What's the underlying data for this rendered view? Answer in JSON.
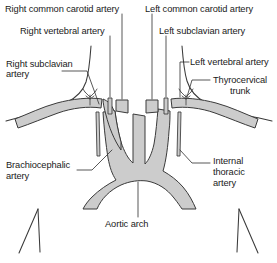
{
  "figure": {
    "type": "anatomical-line-diagram",
    "background_color": "#ffffff",
    "vessel_fill_color": "#cccccc",
    "vessel_outline_color": "#333333",
    "label_color": "#1a1a1a",
    "leader_line_color": "#333333"
  },
  "labels": {
    "right_common_carotid": "Right common carotid artery",
    "right_vertebral": "Right vertebral artery",
    "right_subclavian_line1": "Right subclavian",
    "right_subclavian_line2": "artery",
    "brachiocephalic_line1": "Brachiocephalic",
    "brachiocephalic_line2": "artery",
    "aortic_arch": "Aortic arch",
    "left_common_carotid": "Left common carotid artery",
    "left_subclavian": "Left subclavian artery",
    "left_vertebral": "Left vertebral artery",
    "thyrocervical_line1": "Thyrocervical",
    "thyrocervical_line2": "trunk",
    "internal_thoracic_line1": "Internal",
    "internal_thoracic_line2": "thoracic",
    "internal_thoracic_line3": "artery"
  }
}
